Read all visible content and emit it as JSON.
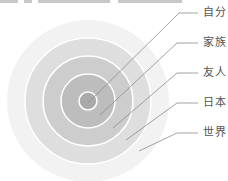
{
  "diagram": {
    "type": "concentric-circles",
    "center": [
      88,
      101
    ],
    "rings": [
      {
        "label": "世界",
        "radius": 81,
        "fill": "#f2f2f2"
      },
      {
        "label": "日本",
        "radius": 63,
        "fill": "#dedede"
      },
      {
        "label": "友人",
        "radius": 45,
        "fill": "#cdcdcd"
      },
      {
        "label": "家族",
        "radius": 27,
        "fill": "#bdbdbd"
      },
      {
        "label": "自分",
        "radius": 9,
        "fill": "#aaaaaa"
      }
    ],
    "ring_border_color": "#ffffff",
    "leader_line_color": "#8c8c8c",
    "labels": [
      {
        "text": "自分",
        "x": 203,
        "y": 7
      },
      {
        "text": "家族",
        "x": 203,
        "y": 37
      },
      {
        "text": "友人",
        "x": 203,
        "y": 67
      },
      {
        "text": "日本",
        "x": 203,
        "y": 97
      },
      {
        "text": "世界",
        "x": 203,
        "y": 127
      }
    ]
  },
  "clipped_header": {
    "visible": true,
    "note_segments": [
      [
        0,
        18
      ],
      [
        24,
        8
      ],
      [
        38,
        72
      ],
      [
        118,
        64
      ]
    ]
  }
}
